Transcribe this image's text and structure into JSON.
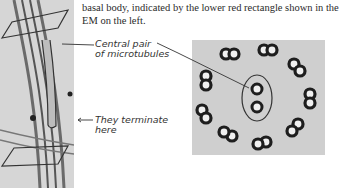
{
  "caption": {
    "line1": "basal body, indicated by the lower red rectangle shown in the",
    "line2": "EM on the left."
  },
  "annotations": {
    "central_pair_line1": "Central pair",
    "central_pair_line2": "of microtubules",
    "terminate_line1": "They terminate",
    "terminate_line2": "here"
  },
  "colors": {
    "ink": "#2a2a2a",
    "em_background": "#d4d4d4"
  }
}
